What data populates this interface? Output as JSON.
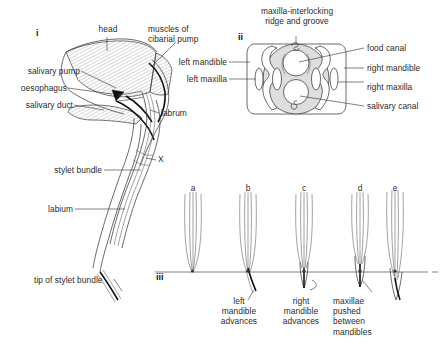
{
  "figure": {
    "panels": {
      "i": "i",
      "ii": "ii",
      "iii": "iii"
    }
  },
  "panel_i": {
    "name": "longitudinal-section-of-head-and-proboscis",
    "labels": {
      "head": "head",
      "muscles": "muscles of\ncibarial pump",
      "salivary_pump": "salivary pump",
      "oesophagus": "oesophagus",
      "salivary_duct": "salivary duct",
      "labrum": "labrum",
      "x": "X",
      "stylet_bundle": "stylet bundle",
      "labium": "labium",
      "tip": "tip of stylet bundle"
    }
  },
  "panel_ii": {
    "name": "cross-section-through-stylet-bundle",
    "labels": {
      "top": "maxilla-interlocking\nridge and groove",
      "left_mandible": "left mandible",
      "left_maxilla": "left maxilla",
      "food_canal": "food canal",
      "right_mandible": "right mandible",
      "right_maxilla": "right maxilla",
      "salivary_canal": "salivary canal"
    }
  },
  "panel_iii": {
    "name": "stylet-penetration-sequence",
    "steps": [
      {
        "key": "a",
        "caption": ""
      },
      {
        "key": "b",
        "caption": "left\nmandible\nadvances"
      },
      {
        "key": "c",
        "caption": "right\nmandible\nadvances"
      },
      {
        "key": "d",
        "caption": "maxillae\npushed\nbetween\nmandibles"
      },
      {
        "key": "e",
        "caption": ""
      }
    ]
  },
  "colors": {
    "ink": "#3a3a3a",
    "text": "#2b2b2b",
    "fill_gray": "#dedede",
    "canal_white": "#ffffff",
    "dark_accent": "#111111"
  }
}
